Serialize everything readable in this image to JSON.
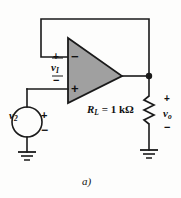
{
  "figure": {
    "caption": "a)",
    "background_color": "#fdfdfc",
    "line_color": "#1a1a1a",
    "opamp_fill_color": "#a0a0a0"
  },
  "labels": {
    "input_voltage": "v",
    "input_voltage_sub": "I",
    "source_voltage": "v",
    "source_voltage_sub": "2",
    "output_voltage": "v",
    "output_voltage_sub": "o",
    "load_resistor": "R",
    "load_resistor_sub": "L",
    "load_value": " = 1 kΩ",
    "plus_sign": "+",
    "minus_sign": "−",
    "opamp_inverting_sign": "−",
    "opamp_noninverting_sign": "+"
  },
  "components": [
    {
      "name": "operational-amplifier",
      "type": "opamp",
      "inverting_input": "−",
      "noninverting_input": "+"
    },
    {
      "name": "voltage-source",
      "type": "independent-voltage-source",
      "label": "v2",
      "polarity_top": "+",
      "polarity_bottom": "−"
    },
    {
      "name": "load-resistor",
      "type": "resistor",
      "label": "R_L",
      "value": "1 kΩ"
    },
    {
      "name": "ground-source",
      "type": "ground"
    },
    {
      "name": "ground-load",
      "type": "ground"
    },
    {
      "name": "feedback-wire",
      "type": "wire"
    },
    {
      "name": "output-node",
      "type": "junction"
    }
  ]
}
